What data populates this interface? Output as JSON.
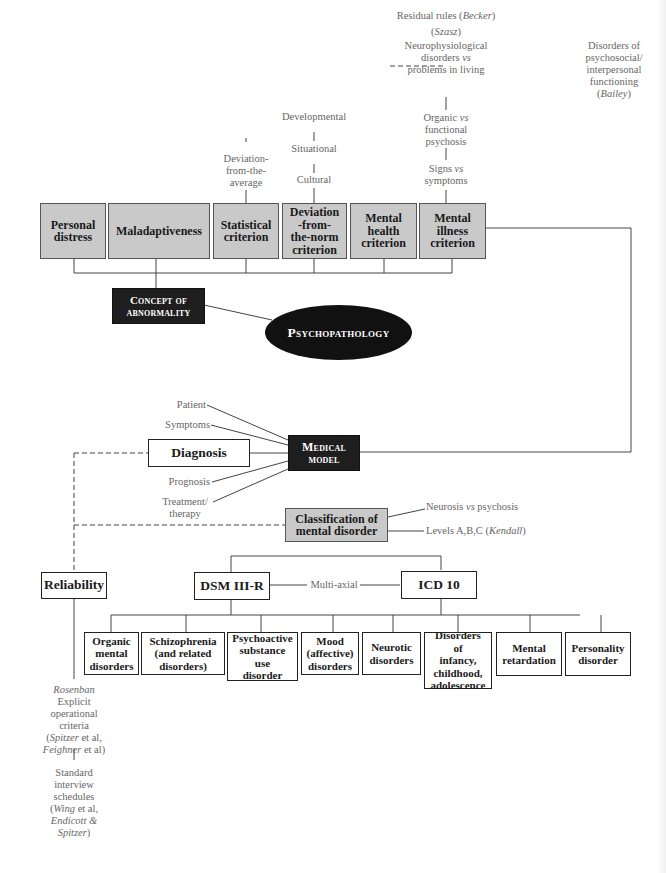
{
  "title": "Psychopathology",
  "central_node": {
    "label": "Psychopathology"
  },
  "concept_node": {
    "label_line1": "Concept of",
    "label_line2": "abnormality"
  },
  "criteria": [
    {
      "id": "personal-distress",
      "label_line1": "Personal",
      "label_line2": "distress"
    },
    {
      "id": "maladaptiveness",
      "label_line1": "Maladaptiveness"
    },
    {
      "id": "statistical",
      "label_line1": "Statistical",
      "label_line2": "criterion"
    },
    {
      "id": "deviation-norm",
      "label_line1": "Deviation",
      "label_line2": "-from-",
      "label_line3": "the-norm",
      "label_line4": "criterion"
    },
    {
      "id": "mental-health",
      "label_line1": "Mental",
      "label_line2": "health",
      "label_line3": "criterion"
    },
    {
      "id": "mental-illness",
      "label_line1": "Mental",
      "label_line2": "illness",
      "label_line3": "criterion"
    }
  ],
  "statistical_note": {
    "line1": "Deviation-",
    "line2": "from-the-",
    "line3": "average"
  },
  "norm_chain": [
    "Developmental",
    "Situational",
    "Cultural"
  ],
  "illness_chain": {
    "residual": {
      "text": "Residual rules (",
      "author": "Becker",
      "close": ")"
    },
    "szasz": {
      "open": "(",
      "author": "Szasz",
      "close": ")"
    },
    "neuro": {
      "line1": "Neurophysiological",
      "line2a": "disorders ",
      "line2vs": "vs",
      "line3": "problems in living"
    },
    "organic": {
      "line1a": "Organic ",
      "line1vs": "vs",
      "line2": "functional",
      "line3": "psychosis"
    },
    "signs": {
      "line1a": "Signs ",
      "line1vs": "vs",
      "line2": "symptoms"
    },
    "bailey": {
      "line1": "Disorders of",
      "line2": "psychosocial/",
      "line3": "interpersonal",
      "line4": "functioning",
      "line5_open": "(",
      "line5_author": "Bailey",
      "line5_close": ")"
    }
  },
  "medical_model": {
    "label_line1": "Medical",
    "label_line2": "model",
    "inputs": [
      "Patient",
      "Symptoms",
      "Prognosis",
      "Treatment/",
      "therapy"
    ]
  },
  "diagnosis": {
    "label": "Diagnosis"
  },
  "classification": {
    "label_line1": "Classification of",
    "label_line2": "mental disorder",
    "notes": {
      "neurosis_a": "Neurosis ",
      "neurosis_vs": "vs",
      "neurosis_b": " psychosis",
      "levels_a": "Levels A,B,C (",
      "levels_author": "Kendall",
      "levels_b": ")"
    }
  },
  "reliability": {
    "label": "Reliability",
    "notes": {
      "rosenban": "Rosenban",
      "explicit_1": "Explicit",
      "explicit_2": "operational",
      "explicit_3": "criteria",
      "spitzer_open": "(",
      "spitzer": "Spitzer",
      "spitzer_etal": " et al,",
      "feighner": "Feighner",
      "feighner_etal": " et al)",
      "standard_1": "Standard",
      "standard_2": "interview",
      "standard_3": "schedules",
      "wing_open": "(",
      "wing": "Wing",
      "wing_etal": " et al,",
      "endicott": "Endicott &",
      "spitzer2": "Spitzer",
      "spitzer2_close": ")"
    }
  },
  "systems": {
    "dsm": {
      "label": "DSM III-R"
    },
    "icd": {
      "label": "ICD 10"
    },
    "link_label": "Multi-axial"
  },
  "disorders": [
    {
      "lines": [
        "Organic",
        "mental",
        "disorders"
      ]
    },
    {
      "lines": [
        "Schizophrenia",
        "(and related",
        "disorders)"
      ]
    },
    {
      "lines": [
        "Psychoactive",
        "substance",
        "use",
        "disorder"
      ]
    },
    {
      "lines": [
        "Mood",
        "(affective)",
        "disorders"
      ]
    },
    {
      "lines": [
        "Neurotic",
        "disorders"
      ]
    },
    {
      "lines": [
        "Disorders",
        "of",
        "infancy,",
        "childhood,",
        "adolescence"
      ]
    },
    {
      "lines": [
        "Mental",
        "retardation"
      ]
    },
    {
      "lines": [
        "Personality",
        "disorder"
      ]
    }
  ],
  "colors": {
    "grey_box": "#c9c9c9",
    "dark_box": "#1e1e1e",
    "line": "#444444",
    "label_text": "#666666"
  }
}
